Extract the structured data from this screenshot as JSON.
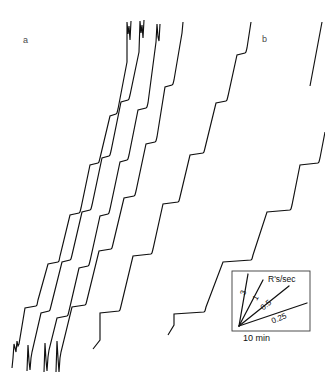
{
  "figure": {
    "type": "cumulative-record",
    "background_color": "#ffffff",
    "ink_color": "#111111",
    "panels": [
      {
        "id": "a",
        "label": "a",
        "label_x": 23,
        "label_y": 36
      },
      {
        "id": "b",
        "label": "b",
        "label_x": 262,
        "label_y": 35
      }
    ]
  },
  "legend": {
    "box": {
      "x": 232,
      "y": 271,
      "width": 78,
      "height": 60
    },
    "y_axis_label": "300 R's",
    "x_axis_label": "10 min",
    "title": "R's/sec",
    "rate_lines": [
      {
        "label": "3",
        "rate": 3,
        "label_x": 243,
        "label_y": 291,
        "label_rotate": -72
      },
      {
        "label": "1",
        "rate": 1,
        "label_x": 255,
        "label_y": 296,
        "label_rotate": -60
      },
      {
        "label": "0.5",
        "rate": 0.5,
        "label_x": 262,
        "label_y": 305,
        "label_rotate": -40
      },
      {
        "label": "0.25",
        "rate": 0.25,
        "label_x": 272,
        "label_y": 318,
        "label_rotate": -23
      }
    ]
  },
  "chart_data": {
    "type": "line",
    "title": "",
    "subtitle": "",
    "xlabel": "10 min",
    "ylabel": "300 R's",
    "legend_title": "R's/sec",
    "legend_position": "inset-bottom-right",
    "grid": false,
    "axis_note": "Cumulative response records; x = time, y = cumulative responses. No numeric axes drawn; calibration given by inset rate lines.",
    "calibration": {
      "y_unit": "300 R's",
      "x_unit": "10 min",
      "rate_unit": "R's/sec",
      "rates": [
        3,
        1,
        0.5,
        0.25
      ]
    },
    "series": [
      {
        "name": "a-record-1",
        "panel": "a",
        "comment": "steep cumulative record, leftmost in panel a, reset stroke at start and end",
        "points": [
          [
            12,
            368
          ],
          [
            14,
            344
          ],
          [
            17,
            341
          ],
          [
            18,
            346
          ],
          [
            25,
            308
          ],
          [
            36,
            306
          ],
          [
            38,
            300
          ],
          [
            48,
            264
          ],
          [
            58,
            262
          ],
          [
            60,
            256
          ],
          [
            70,
            215
          ],
          [
            79,
            213
          ],
          [
            81,
            208
          ],
          [
            90,
            165
          ],
          [
            98,
            163
          ],
          [
            100,
            158
          ],
          [
            110,
            116
          ],
          [
            116,
            114
          ],
          [
            118,
            109
          ],
          [
            127,
            62
          ],
          [
            127,
            22
          ],
          [
            130,
            40
          ],
          [
            131,
            21
          ]
        ]
      },
      {
        "name": "a-record-2",
        "panel": "a",
        "comment": "second steep record in panel a",
        "points": [
          [
            27,
            371
          ],
          [
            28,
            345
          ],
          [
            30,
            370
          ],
          [
            32,
            352
          ],
          [
            41,
            313
          ],
          [
            49,
            311
          ],
          [
            51,
            306
          ],
          [
            62,
            262
          ],
          [
            70,
            260
          ],
          [
            72,
            255
          ],
          [
            82,
            212
          ],
          [
            90,
            210
          ],
          [
            92,
            205
          ],
          [
            102,
            158
          ],
          [
            109,
            156
          ],
          [
            111,
            151
          ],
          [
            121,
            102
          ],
          [
            128,
            100
          ],
          [
            130,
            95
          ],
          [
            139,
            52
          ],
          [
            140,
            21
          ],
          [
            143,
            38
          ],
          [
            144,
            20
          ]
        ]
      },
      {
        "name": "a-record-3",
        "panel": "a",
        "comment": "third steep record in panel a",
        "points": [
          [
            44,
            372
          ],
          [
            45,
            343
          ],
          [
            47,
            371
          ],
          [
            49,
            350
          ],
          [
            57,
            318
          ],
          [
            67,
            316
          ],
          [
            69,
            311
          ],
          [
            79,
            268
          ],
          [
            88,
            266
          ],
          [
            90,
            261
          ],
          [
            100,
            216
          ],
          [
            108,
            214
          ],
          [
            110,
            209
          ],
          [
            120,
            162
          ],
          [
            127,
            160
          ],
          [
            129,
            155
          ],
          [
            138,
            110
          ],
          [
            146,
            108
          ],
          [
            148,
            103
          ],
          [
            156,
            42
          ],
          [
            157,
            24
          ],
          [
            159,
            41
          ],
          [
            160,
            24
          ]
        ]
      },
      {
        "name": "a-record-4",
        "panel": "a",
        "comment": "fourth record in panel a, shallower slope with longer pauses",
        "points": [
          [
            56,
            372
          ],
          [
            57,
            341
          ],
          [
            59,
            372
          ],
          [
            61,
            352
          ],
          [
            72,
            307
          ],
          [
            85,
            305
          ],
          [
            87,
            300
          ],
          [
            99,
            251
          ],
          [
            111,
            249
          ],
          [
            113,
            244
          ],
          [
            124,
            198
          ],
          [
            134,
            196
          ],
          [
            136,
            191
          ],
          [
            146,
            144
          ],
          [
            155,
            142
          ],
          [
            157,
            137
          ],
          [
            165,
            87
          ],
          [
            172,
            85
          ],
          [
            174,
            80
          ],
          [
            182,
            33
          ],
          [
            183,
            22
          ]
        ]
      },
      {
        "name": "a-record-5",
        "panel": "a",
        "comment": "rightmost record of panel a with wide flat pauses",
        "points": [
          [
            93,
            349
          ],
          [
            100,
            340
          ],
          [
            100,
            313
          ],
          [
            119,
            311
          ],
          [
            121,
            306
          ],
          [
            133,
            256
          ],
          [
            151,
            254
          ],
          [
            153,
            249
          ],
          [
            163,
            204
          ],
          [
            178,
            202
          ],
          [
            180,
            197
          ],
          [
            190,
            155
          ],
          [
            203,
            153
          ],
          [
            205,
            148
          ],
          [
            216,
            103
          ],
          [
            226,
            101
          ],
          [
            228,
            96
          ],
          [
            237,
            55
          ],
          [
            245,
            53
          ],
          [
            247,
            48
          ],
          [
            251,
            22
          ]
        ]
      },
      {
        "name": "b-record-1",
        "panel": "b",
        "comment": "panel b staircase: long flat pauses separated by steep runs",
        "points": [
          [
            168,
            335
          ],
          [
            174,
            325
          ],
          [
            174,
            314
          ],
          [
            204,
            312
          ],
          [
            206,
            307
          ],
          [
            223,
            262
          ],
          [
            251,
            260
          ],
          [
            253,
            255
          ],
          [
            267,
            212
          ],
          [
            290,
            210
          ],
          [
            292,
            205
          ],
          [
            300,
            165
          ],
          [
            318,
            163
          ],
          [
            320,
            158
          ],
          [
            325,
            133
          ],
          [
            322,
            22
          ]
        ]
      }
    ]
  }
}
